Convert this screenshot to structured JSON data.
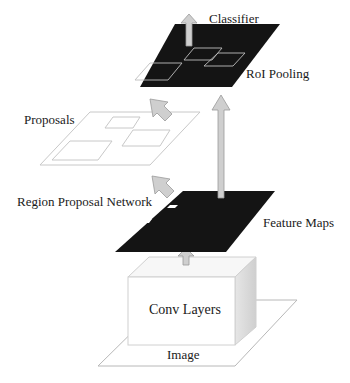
{
  "diagram": {
    "labels": {
      "classifier": "Classifier",
      "roi_pooling": "RoI Pooling",
      "proposals": "Proposals",
      "rpn": "Region Proposal Network",
      "feature_maps": "Feature Maps",
      "conv_layers": "Conv Layers",
      "image": "Image"
    },
    "colors": {
      "map_fill": "#141414",
      "arrow_fill": "#cfcfcf",
      "arrow_stroke": "#9a9a9a",
      "outline": "#c8c8c8",
      "box_side": "#dcdcdc"
    },
    "flow": [
      "Image",
      "Conv Layers",
      "Feature Maps",
      "Region Proposal Network",
      "Proposals",
      "RoI Pooling",
      "Classifier"
    ]
  }
}
